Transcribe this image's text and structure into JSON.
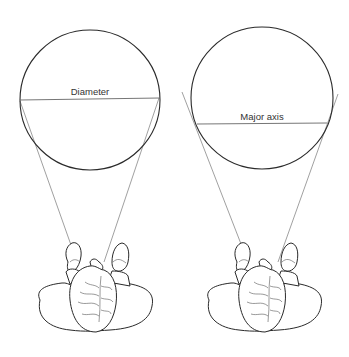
{
  "figure": {
    "panels": [
      {
        "id": "left",
        "circle_label": "Diameter",
        "description": "Top-down figure with two sight lines meeting the circle at the ends of its diameter"
      },
      {
        "id": "right",
        "circle_label": "Major axis",
        "description": "Top-down figure with two sight lines tangent to the circle; chord labeled as major axis"
      }
    ],
    "colors": {
      "stroke": "#2a2a2a",
      "sight_line": "#777777",
      "background": "#ffffff"
    }
  }
}
